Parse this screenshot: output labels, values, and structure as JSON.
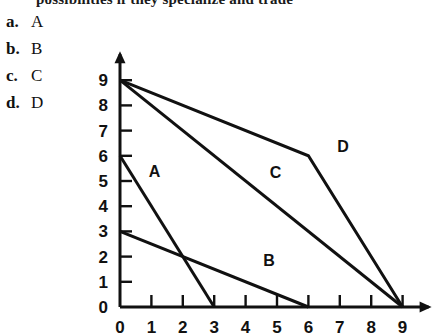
{
  "header": {
    "clipped_text": "possibilities if they specialize and trade"
  },
  "choices": [
    {
      "key": "a.",
      "value": "A"
    },
    {
      "key": "b.",
      "value": "B"
    },
    {
      "key": "c.",
      "value": "C"
    },
    {
      "key": "d.",
      "value": "D"
    }
  ],
  "chart_data": {
    "type": "line",
    "title": "",
    "xlabel": "X",
    "ylabel": "Y",
    "xlim": [
      0,
      9
    ],
    "ylim": [
      0,
      9
    ],
    "xticks": [
      "0",
      "1",
      "2",
      "3",
      "4",
      "5",
      "6",
      "7",
      "8",
      "9"
    ],
    "yticks": [
      "0",
      "1",
      "2",
      "3",
      "4",
      "5",
      "6",
      "7",
      "8",
      "9"
    ],
    "grid": false,
    "legend": "inline-labels",
    "series": [
      {
        "name": "A",
        "label": "A",
        "label_at": [
          1.1,
          5.4
        ],
        "points": [
          [
            0,
            6
          ],
          [
            3,
            0
          ]
        ]
      },
      {
        "name": "B",
        "label": "B",
        "label_at": [
          4.75,
          1.85
        ],
        "points": [
          [
            0,
            3
          ],
          [
            6,
            0
          ]
        ]
      },
      {
        "name": "C",
        "label": "C",
        "label_at": [
          4.95,
          5.35
        ],
        "points": [
          [
            0,
            9
          ],
          [
            9,
            0
          ]
        ]
      },
      {
        "name": "D",
        "label": "D",
        "label_at": [
          7.1,
          6.4
        ],
        "points": [
          [
            0,
            9
          ],
          [
            6,
            6
          ],
          [
            9,
            0
          ]
        ]
      }
    ]
  },
  "colors": {
    "ink": "#111111",
    "background": "#ffffff"
  }
}
